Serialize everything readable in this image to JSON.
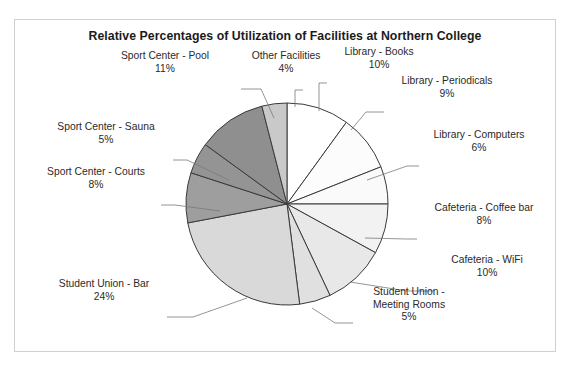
{
  "page": {
    "top_bleed_text": "· ·   ·  ·  ·      ·   ·  ·   ·"
  },
  "chart_frame": {
    "border_color": "#d0d0d0",
    "background": "#ffffff"
  },
  "chart_data": {
    "type": "pie",
    "title": "Relative Percentages of Utilization of Facilities at Northern College",
    "xlabel": "",
    "ylabel": "",
    "legend_position": "none",
    "grid": false,
    "units": "%",
    "start_angle_deg": 0,
    "direction": "clockwise",
    "total": 100,
    "categories": [
      "Library - Books",
      "Library - Periodicals",
      "Library - Computers",
      "Cafeteria - Coffee bar",
      "Cafeteria - WiFi",
      "Student Union - Meeting Rooms",
      "Student Union - Bar",
      "Sport Center - Courts",
      "Sport Center - Sauna",
      "Sport Center - Pool",
      "Other Facilities"
    ],
    "values": [
      10,
      9,
      6,
      8,
      10,
      5,
      24,
      8,
      5,
      11,
      4
    ],
    "colors": [
      "#ffffff",
      "#fcfcfc",
      "#fafafa",
      "#f2f2f2",
      "#e8e8e8",
      "#e0e0e0",
      "#d9d9d9",
      "#9e9e9e",
      "#949494",
      "#8f8f8f",
      "#c9c9c9"
    ],
    "slice_border_color": "#3a3a3a",
    "slices": [
      {
        "label": "Library - Books",
        "value": 10,
        "pct_text": "10%",
        "color": "#ffffff"
      },
      {
        "label": "Library - Periodicals",
        "value": 9,
        "pct_text": "9%",
        "color": "#fcfcfc"
      },
      {
        "label": "Library - Computers",
        "value": 6,
        "pct_text": "6%",
        "color": "#fafafa"
      },
      {
        "label": "Cafeteria - Coffee bar",
        "value": 8,
        "pct_text": "8%",
        "color": "#f2f2f2"
      },
      {
        "label": "Cafeteria - WiFi",
        "value": 10,
        "pct_text": "10%",
        "color": "#e8e8e8"
      },
      {
        "label": "Student Union - Meeting Rooms",
        "value": 5,
        "pct_text": "5%",
        "color": "#e0e0e0"
      },
      {
        "label": "Student Union - Bar",
        "value": 24,
        "pct_text": "24%",
        "color": "#d9d9d9"
      },
      {
        "label": "Sport Center - Courts",
        "value": 8,
        "pct_text": "8%",
        "color": "#9e9e9e"
      },
      {
        "label": "Sport Center - Sauna",
        "value": 5,
        "pct_text": "5%",
        "color": "#949494"
      },
      {
        "label": "Sport Center - Pool",
        "value": 11,
        "pct_text": "11%",
        "color": "#8f8f8f"
      },
      {
        "label": "Other Facilities",
        "value": 4,
        "pct_text": "4%",
        "color": "#c9c9c9"
      }
    ]
  },
  "labels": {
    "sport_center_pool": {
      "name": "Sport Center - Pool",
      "pct": "11%"
    },
    "other_facilities": {
      "name": "Other Facilities",
      "pct": "4%"
    },
    "library_books": {
      "name": "Library - Books",
      "pct": "10%"
    },
    "library_periodicals": {
      "name": "Library - Periodicals",
      "pct": "9%"
    },
    "library_computers": {
      "name": "Library - Computers",
      "pct": "6%"
    },
    "cafeteria_coffee": {
      "name": "Cafeteria - Coffee bar",
      "pct": "8%"
    },
    "cafeteria_wifi": {
      "name": "Cafeteria - WiFi",
      "pct": "10%"
    },
    "su_meeting_line1": {
      "name": "Student Union -",
      "line2": "Meeting Rooms",
      "pct": "5%"
    },
    "su_bar": {
      "name": "Student Union - Bar",
      "pct": "24%"
    },
    "sport_center_courts": {
      "name": "Sport Center - Courts",
      "pct": "8%"
    },
    "sport_center_sauna": {
      "name": "Sport Center - Sauna",
      "pct": "5%"
    }
  }
}
